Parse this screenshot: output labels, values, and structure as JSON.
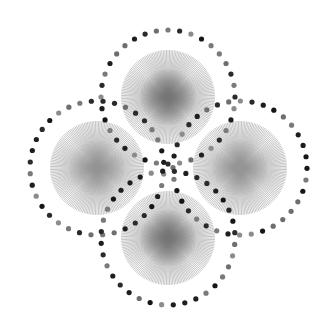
{
  "figure": {
    "width": 330,
    "height": 330,
    "background": "#ffffff",
    "motifs": [
      {
        "name": "top",
        "cx": 168,
        "cy": 97,
        "burst_radius": 47,
        "ring_radius": 67,
        "core_color": "#707070",
        "core_opacity": 0.85
      },
      {
        "name": "left",
        "cx": 97,
        "cy": 168,
        "burst_radius": 47,
        "ring_radius": 67,
        "core_color": "#9a9a9a",
        "core_opacity": 0.7
      },
      {
        "name": "right",
        "cx": 240,
        "cy": 168,
        "burst_radius": 47,
        "ring_radius": 67,
        "core_color": "#9a9a9a",
        "core_opacity": 0.7
      },
      {
        "name": "bottom",
        "cx": 168,
        "cy": 238,
        "burst_radius": 47,
        "ring_radius": 67,
        "core_color": "#707070",
        "core_opacity": 0.85
      }
    ],
    "burst": {
      "line_count": 180,
      "line_color": "#8a8a8a",
      "line_width": 0.5
    },
    "ring": {
      "dot_count": 36,
      "dot_radius": 2.6,
      "dot_colors": [
        "#1e1e1e",
        "#7a7a7a",
        "#2a2a2a",
        "#8c8c8c",
        "#161616",
        "#6e6e6e"
      ]
    }
  }
}
